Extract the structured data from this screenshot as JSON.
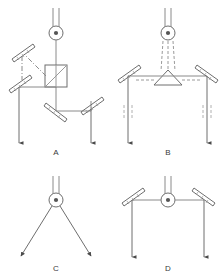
{
  "figure": {
    "type": "optical-schematic-diagram",
    "background_color": "#ffffff",
    "line_color": "#6e6e6e",
    "dark_line_color": "#4a4a4a",
    "label_color": "#3a3a3a",
    "panel_count": 4
  },
  "panels": [
    {
      "id": "A",
      "label": "A",
      "label_x": 56,
      "label_y": 152,
      "description": "Source beam into beamsplitter cube, reflected path via two upper mirrors, transmitted path via two lower mirrors, two downward output arrows",
      "components": [
        {
          "name": "light-source",
          "kind": "source-circle",
          "cx": 56,
          "cy": 33,
          "r": 7
        },
        {
          "name": "beamsplitter-cube",
          "kind": "cube",
          "x": 45,
          "y": 65,
          "w": 22,
          "h": 22
        },
        {
          "name": "mirror-upper-left",
          "kind": "mirror",
          "cx": 22,
          "cy": 52,
          "angle": -45
        },
        {
          "name": "mirror-mid-left",
          "kind": "mirror",
          "cx": 19,
          "cy": 83,
          "angle": -45
        },
        {
          "name": "mirror-lower-mid",
          "kind": "mirror",
          "cx": 57,
          "cy": 111,
          "angle": 45
        },
        {
          "name": "mirror-lower-right",
          "kind": "mirror",
          "cx": 91,
          "cy": 105,
          "angle": -45
        },
        {
          "name": "output-arrow-left",
          "kind": "arrow-down",
          "x": 19,
          "y_end": 147
        },
        {
          "name": "output-arrow-right",
          "kind": "arrow-down",
          "x": 91,
          "y_end": 147
        }
      ]
    },
    {
      "id": "B",
      "label": "B",
      "label_x": 168,
      "label_y": 152,
      "description": "Source beam down onto a triangular prism, split left and right to two mirrors, then two downward output arrows with dashed wave markers",
      "components": [
        {
          "name": "light-source",
          "kind": "source-circle",
          "cx": 168,
          "cy": 33,
          "r": 7
        },
        {
          "name": "prism-triangle",
          "kind": "prism",
          "cx": 168,
          "cy": 78,
          "w": 28,
          "h": 14
        },
        {
          "name": "mirror-left",
          "kind": "mirror",
          "cx": 128,
          "cy": 74,
          "angle": -45
        },
        {
          "name": "mirror-right",
          "kind": "mirror",
          "cx": 207,
          "cy": 74,
          "angle": 45
        },
        {
          "name": "output-arrow-left",
          "kind": "arrow-down",
          "x": 128,
          "y_end": 147
        },
        {
          "name": "output-arrow-right",
          "kind": "arrow-down",
          "x": 207,
          "y_end": 147
        },
        {
          "name": "dashed-marker-left",
          "kind": "dashed-ticks",
          "x": 128,
          "y": 112
        },
        {
          "name": "dashed-marker-right",
          "kind": "dashed-ticks",
          "x": 207,
          "y": 112
        }
      ]
    },
    {
      "id": "C",
      "label": "C",
      "label_x": 56,
      "label_y": 268,
      "description": "Source with two symmetric diverging beams ending in arrowheads",
      "components": [
        {
          "name": "light-source",
          "kind": "source-circle",
          "cx": 56,
          "cy": 200,
          "r": 7
        },
        {
          "name": "diverging-beam-left",
          "kind": "arrow-diagonal",
          "x2": 20,
          "y2": 258
        },
        {
          "name": "diverging-beam-right",
          "kind": "arrow-diagonal",
          "x2": 92,
          "y2": 258
        }
      ]
    },
    {
      "id": "D",
      "label": "D",
      "label_x": 168,
      "label_y": 268,
      "description": "Source emitting horizontally both ways to two 45 degree mirrors, then two parallel downward output arrows",
      "components": [
        {
          "name": "light-source",
          "kind": "source-circle",
          "cx": 168,
          "cy": 200,
          "r": 7
        },
        {
          "name": "mirror-left",
          "kind": "mirror",
          "cx": 132,
          "cy": 196,
          "angle": -45
        },
        {
          "name": "mirror-right",
          "kind": "mirror",
          "cx": 204,
          "cy": 196,
          "angle": 45
        },
        {
          "name": "output-arrow-left",
          "kind": "arrow-down",
          "x": 132,
          "y_end": 260
        },
        {
          "name": "output-arrow-right",
          "kind": "arrow-down",
          "x": 204,
          "y_end": 260
        }
      ]
    }
  ],
  "labels": {
    "a": "A",
    "b": "B",
    "c": "C",
    "d": "D"
  }
}
